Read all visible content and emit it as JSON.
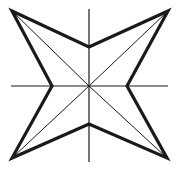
{
  "figure": {
    "background_color": "#ffffff",
    "stroke_color": "#1a1a1a",
    "fill_color": "none",
    "width": 179,
    "height": 173,
    "center": {
      "x": 89,
      "y": 86
    },
    "outline_stroke_width": 3.2,
    "spoke_stroke_width": 1.0,
    "axis_stroke_width": 1.2,
    "star": {
      "name": "four-pointed-star",
      "points": 4,
      "tips": [
        {
          "name": "tip-top-left",
          "x": 12,
          "y": 11
        },
        {
          "name": "tip-top-right",
          "x": 168,
          "y": 11
        },
        {
          "name": "tip-bottom-right",
          "x": 167,
          "y": 158
        },
        {
          "name": "tip-bottom-left",
          "x": 12,
          "y": 158
        }
      ],
      "notches": [
        {
          "name": "notch-top",
          "x": 89,
          "y": 47
        },
        {
          "name": "notch-right",
          "x": 127,
          "y": 86
        },
        {
          "name": "notch-bottom",
          "x": 89,
          "y": 124
        },
        {
          "name": "notch-left",
          "x": 52,
          "y": 86
        }
      ],
      "outline_path": "M 12 11 L 89 47 L 168 11 L 127 86 L 167 158 L 89 124 L 12 158 L 52 86 Z"
    },
    "spokes": [
      {
        "name": "spoke-to-top-left",
        "x1": 89,
        "y1": 86,
        "x2": 12,
        "y2": 11
      },
      {
        "name": "spoke-to-top-right",
        "x1": 89,
        "y1": 86,
        "x2": 168,
        "y2": 11
      },
      {
        "name": "spoke-to-bottom-right",
        "x1": 89,
        "y1": 86,
        "x2": 167,
        "y2": 158
      },
      {
        "name": "spoke-to-bottom-left",
        "x1": 89,
        "y1": 86,
        "x2": 12,
        "y2": 158
      }
    ],
    "axes": [
      {
        "name": "horizontal-axis",
        "x1": 11,
        "y1": 86,
        "x2": 168,
        "y2": 86
      },
      {
        "name": "vertical-axis",
        "x1": 89,
        "y1": 9,
        "x2": 89,
        "y2": 162
      }
    ]
  }
}
